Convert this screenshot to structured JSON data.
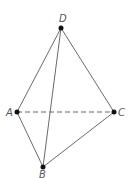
{
  "diagram": {
    "type": "tetrahedron",
    "width": 137,
    "height": 178,
    "colors": {
      "edge": "#6a6a6a",
      "vertex": "#111111",
      "label": "#555555",
      "background": "#ffffff"
    },
    "vertices": [
      {
        "id": "D",
        "label": "D",
        "x": 61,
        "y": 28,
        "label_x": 59,
        "label_y": 22
      },
      {
        "id": "A",
        "label": "A",
        "x": 17,
        "y": 112,
        "label_x": 6,
        "label_y": 116
      },
      {
        "id": "C",
        "label": "C",
        "x": 114,
        "y": 112,
        "label_x": 118,
        "label_y": 116
      },
      {
        "id": "B",
        "label": "B",
        "x": 43,
        "y": 167,
        "label_x": 39,
        "label_y": 178
      }
    ],
    "edges": [
      {
        "from": "D",
        "to": "A",
        "style": "solid"
      },
      {
        "from": "D",
        "to": "C",
        "style": "solid"
      },
      {
        "from": "D",
        "to": "B",
        "style": "solid"
      },
      {
        "from": "A",
        "to": "B",
        "style": "solid"
      },
      {
        "from": "B",
        "to": "C",
        "style": "solid"
      },
      {
        "from": "A",
        "to": "C",
        "style": "dashed"
      }
    ]
  }
}
